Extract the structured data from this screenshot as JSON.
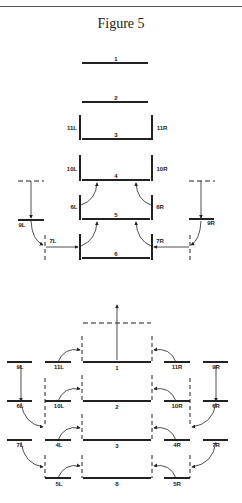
{
  "figure": {
    "title": "Figure 5"
  },
  "upper_diagram": {
    "levels": [
      "1",
      "2",
      "3",
      "4",
      "5",
      "6"
    ],
    "side_labels": [
      "11L",
      "11R",
      "10L",
      "10R",
      "6L",
      "6R",
      "9L",
      "9R",
      "7L",
      "7R"
    ]
  },
  "lower_diagram": {
    "center_levels": [
      "1",
      "2",
      "3",
      "8"
    ],
    "left_inner": [
      "11L",
      "10L",
      "4L",
      "5L"
    ],
    "right_inner": [
      "11R",
      "10R",
      "4R",
      "5R"
    ],
    "left_outer": [
      "9L",
      "6L",
      "7L"
    ],
    "right_outer": [
      "9R",
      "6R",
      "7R"
    ]
  }
}
